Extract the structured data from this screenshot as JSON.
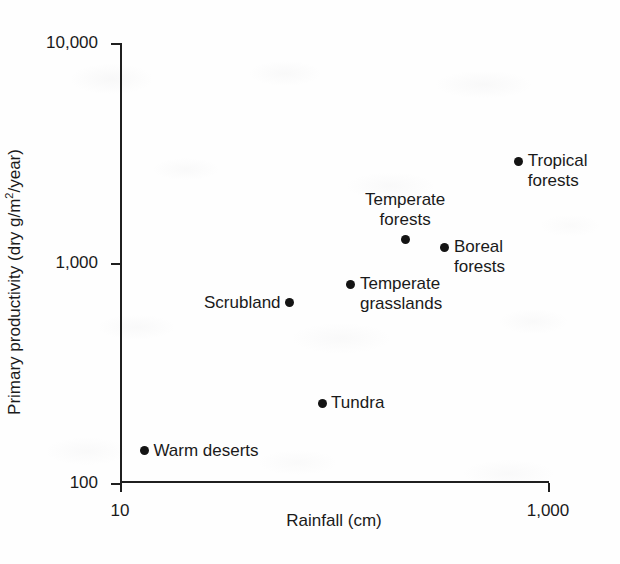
{
  "chart_data": {
    "type": "scatter",
    "title": "",
    "xlabel": "Rainfall (cm)",
    "ylabel": "Primary productivity (dry g/m²/year)",
    "xscale": "log",
    "yscale": "log",
    "xlim": [
      10,
      1000
    ],
    "ylim": [
      100,
      10000
    ],
    "grid": false,
    "legend": "none",
    "xticks": [
      {
        "value": 10,
        "label": "10"
      },
      {
        "value": 1000,
        "label": "1,000"
      }
    ],
    "yticks": [
      {
        "value": 100,
        "label": "100"
      },
      {
        "value": 1000,
        "label": "1,000"
      },
      {
        "value": 10000,
        "label": "10,000"
      }
    ],
    "points": [
      {
        "name": "Warm deserts",
        "label": "Warm deserts",
        "x": 13,
        "y": 140,
        "label_position": "right"
      },
      {
        "name": "Tundra",
        "label": "Tundra",
        "x": 88,
        "y": 230,
        "label_position": "right"
      },
      {
        "name": "Scrubland",
        "label": "Scrubland",
        "x": 62,
        "y": 660,
        "label_position": "left"
      },
      {
        "name": "Temperate grasslands",
        "label": "Temperate\ngrasslands",
        "x": 120,
        "y": 800,
        "label_position": "right"
      },
      {
        "name": "Temperate forests",
        "label": "Temperate\nforests",
        "x": 215,
        "y": 1280,
        "label_position": "above"
      },
      {
        "name": "Boreal forests",
        "label": "Boreal\nforests",
        "x": 330,
        "y": 1180,
        "label_position": "right"
      },
      {
        "name": "Tropical forests",
        "label": "Tropical\nforests",
        "x": 730,
        "y": 2900,
        "label_position": "right"
      }
    ]
  },
  "colors": {
    "marker": "#141414",
    "axis": "#1f1f1f",
    "background": "#fefefe",
    "text": "#1a1a1a"
  }
}
